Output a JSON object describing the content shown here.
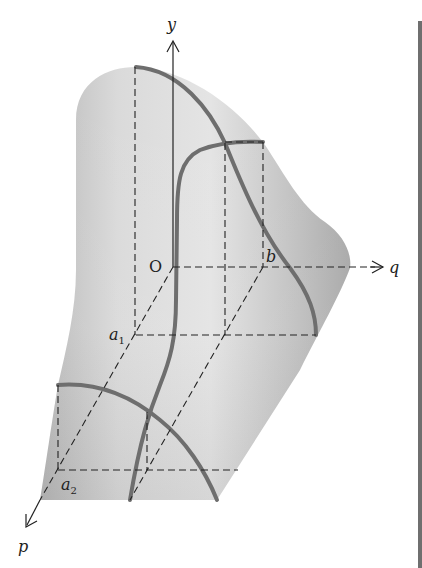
{
  "figure": {
    "axes": {
      "y": {
        "label": "y"
      },
      "q": {
        "label": "q"
      },
      "p": {
        "label": "p"
      }
    },
    "points": {
      "origin": {
        "label": "O"
      },
      "b": {
        "label": "b"
      },
      "a1": {
        "label": "a",
        "subscript": "1"
      },
      "a2": {
        "label": "a",
        "subscript": "2"
      }
    },
    "colors": {
      "surface_light": "#e2e2e2",
      "surface_dark": "#a9a9a9",
      "curve": "#6e6e6e",
      "dash": "#222222",
      "side_bar": "#6f6f6f"
    }
  }
}
